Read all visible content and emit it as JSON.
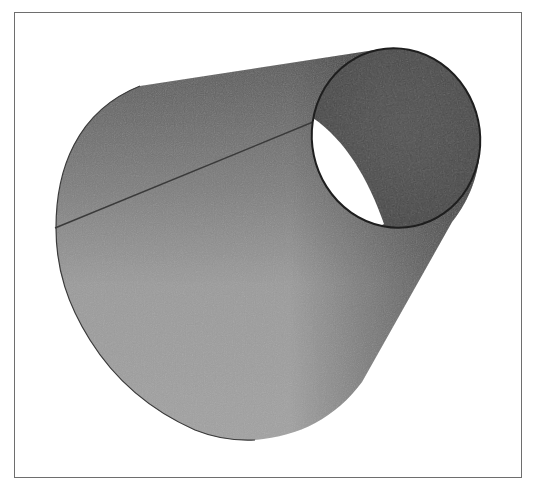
{
  "figure": {
    "title": "",
    "frame_color": "#6e6e6e",
    "background_color": "#ffffff"
  },
  "shape": {
    "body": {
      "outline_color": "#2a2a2a",
      "shade_light": "#a3a3a3",
      "shade_mid": "#8a8a8a",
      "shade_dark_top": "#5a5a5a",
      "shade_dark_right": "#4e4e4e"
    },
    "small_end_opening": {
      "center_x": 396,
      "center_y": 138,
      "radius_x": 84,
      "radius_y": 90,
      "rotation_deg": -12,
      "interior_color": "#4a4a4a",
      "rim_color": "#1e1e1e",
      "see_through_highlight_color": "#ffffff"
    },
    "seam_line": {
      "x1": 55,
      "y1": 228,
      "x2": 313,
      "y2": 122,
      "color": "#3a3a3a"
    }
  }
}
